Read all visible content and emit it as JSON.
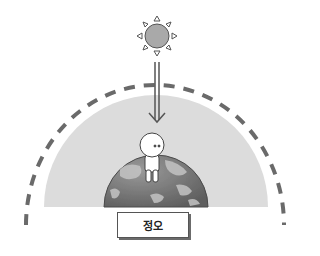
{
  "diagram": {
    "title_label": "정오",
    "elements": {
      "sun": "sun-icon",
      "sunlight_arrow": "downward-arrow",
      "atmosphere": "atmosphere-semicircle",
      "outer_boundary": "dashed-arc",
      "earth": "earth-globe",
      "character": "person-figure"
    },
    "colors": {
      "atmosphere": "#dcdcdc",
      "sun_fill": "#a9a9a9",
      "earth_dark": "#6f6f6f",
      "earth_light": "#b8b8b8",
      "dash": "#6a6a6a"
    }
  }
}
